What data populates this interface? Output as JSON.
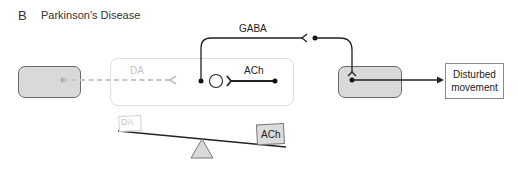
{
  "figure": {
    "panel_letter": "B",
    "title": "Parkinson's Disease"
  },
  "pathway": {
    "gaba_label": "GABA",
    "da_label": "DA",
    "ach_label": "ACh",
    "plus_symbol": "+",
    "output_label_line1": "Disturbed",
    "output_label_line2": "movement"
  },
  "balance": {
    "left_weight_label": "DA",
    "right_weight_label": "ACh"
  },
  "colors": {
    "gray_box_fill": "#d9d9d9",
    "faded_stroke": "#c8c8c8",
    "line": "#222222"
  }
}
